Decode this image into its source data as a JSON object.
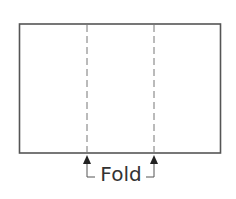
{
  "diagram": {
    "title": "",
    "label": "Fold",
    "shape": "rectangle",
    "fold_lines": 2,
    "fold_line_style": "dashed",
    "colors": {
      "stroke": "#555555",
      "dashed": "#777777",
      "text": "#333333",
      "background": "#ffffff"
    },
    "icons": [
      "arrow-up-icon",
      "arrow-up-icon"
    ]
  }
}
